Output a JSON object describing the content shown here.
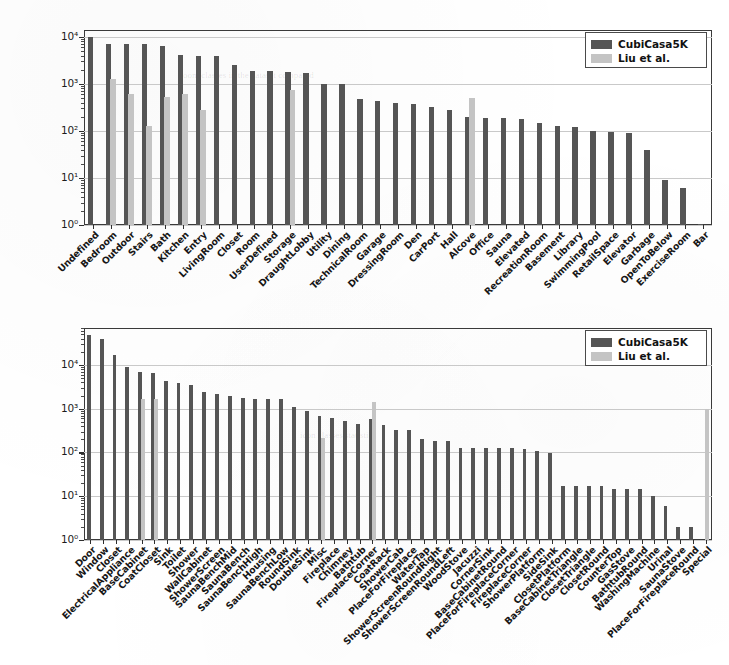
{
  "figure": {
    "background_color": "#ffffff",
    "series_colors": {
      "cubicasa": "#555555",
      "liu": "#c4c4c4"
    }
  },
  "legend": {
    "entries": [
      {
        "label": "CubiCasa5K",
        "color": "#555555"
      },
      {
        "label": "Liu et al.",
        "color": "#c4c4c4"
      }
    ]
  },
  "ghost": {
    "line1": "room classes in the dataset compared",
    "line2": "icon classes statistics"
  },
  "chart_data": [
    {
      "type": "bar",
      "title": "",
      "xlabel": "",
      "ylabel": "",
      "yscale": "log",
      "ylim": [
        1,
        14000
      ],
      "ytick_labels": [
        "10⁰",
        "10¹",
        "10²",
        "10³",
        "10⁴"
      ],
      "ytick_values": [
        1,
        10,
        100,
        1000,
        10000
      ],
      "grid": true,
      "legend_position": "upper right",
      "categories": [
        "Undefined",
        "Bedroom",
        "Outdoor",
        "Stairs",
        "Bath",
        "Kitchen",
        "Entry",
        "LivingRoom",
        "Closet",
        "Room",
        "UserDefined",
        "Storage",
        "DraughtLobby",
        "Utility",
        "Dining",
        "TechnicalRoom",
        "Garage",
        "DressingRoom",
        "Den",
        "CarPort",
        "Hall",
        "Alcove",
        "Office",
        "Sauna",
        "Elevated",
        "RecreationRoom",
        "Basement",
        "Library",
        "SwimmingPool",
        "RetailSpace",
        "Elevator",
        "Garbage",
        "OpenToBelow",
        "ExerciseRoom",
        "Bar"
      ],
      "series": [
        {
          "name": "CubiCasa5K",
          "color": "#555555",
          "values": [
            10000,
            7200,
            6900,
            6900,
            6400,
            4200,
            4000,
            3900,
            2500,
            1900,
            1900,
            1800,
            1700,
            1000,
            1000,
            470,
            430,
            400,
            380,
            330,
            280,
            200,
            190,
            190,
            180,
            150,
            130,
            120,
            100,
            95,
            90,
            40,
            9,
            6,
            1
          ]
        },
        {
          "name": "Liu et al.",
          "color": "#c4c4c4",
          "values": [
            null,
            1300,
            620,
            130,
            520,
            600,
            280,
            null,
            null,
            null,
            null,
            750,
            null,
            null,
            null,
            null,
            null,
            null,
            null,
            null,
            null,
            500,
            null,
            null,
            null,
            null,
            null,
            null,
            null,
            null,
            null,
            null,
            null,
            null,
            null
          ]
        }
      ]
    },
    {
      "type": "bar",
      "title": "",
      "xlabel": "",
      "ylabel": "",
      "yscale": "log",
      "ylim": [
        1,
        70000
      ],
      "ytick_labels": [
        "10⁰",
        "10¹",
        "10²",
        "10³",
        "10⁴"
      ],
      "ytick_values": [
        1,
        10,
        100,
        1000,
        10000
      ],
      "grid": true,
      "legend_position": "upper right",
      "categories": [
        "Door",
        "Window",
        "Closet",
        "ElectricalAppliance",
        "BaseCabinet",
        "CoatCloset",
        "Sink",
        "Toilet",
        "Shower",
        "WallCabinet",
        "ShowerScreen",
        "SaunaBenchMid",
        "SaunaBench",
        "SaunaBenchHigh",
        "Housing",
        "SaunaBenchLow",
        "RoundSink",
        "DoubleSink",
        "Misc",
        "Fireplace",
        "Chimney",
        "Bathtub",
        "FireplaceCorner",
        "CoatRack",
        "ShowerCab",
        "PlaceForFireplace",
        "WaterTap",
        "ShowerScreenRoundRight",
        "ShowerScreenRoundLeft",
        "WoodStove",
        "Jacuzzi",
        "CornerSink",
        "BaseCabinetRound",
        "PlaceForFireplaceCorner",
        "FireplaceCorner",
        "ShowerPlatform",
        "SideSink",
        "ClosetPlatform",
        "BaseCabinetTriangle",
        "ClosetTriangle",
        "ClosetRound",
        "CounterTop",
        "GasStove",
        "BathtubRound",
        "WashingMachine",
        "Urinal",
        "SaunaStove",
        "PlaceForFireplaceRound",
        "Special"
      ],
      "series": [
        {
          "name": "CubiCasa5K",
          "color": "#555555",
          "values": [
            48000,
            40000,
            17000,
            9000,
            7000,
            6400,
            4300,
            3900,
            3400,
            2400,
            2200,
            2000,
            1800,
            1700,
            1700,
            1700,
            1100,
            880,
            700,
            600,
            520,
            450,
            580,
            420,
            330,
            330,
            200,
            180,
            180,
            130,
            130,
            130,
            130,
            130,
            120,
            110,
            95,
            17,
            17,
            17,
            17,
            15,
            15,
            15,
            10,
            6,
            2,
            2,
            null
          ]
        },
        {
          "name": "Liu et al.",
          "color": "#c4c4c4",
          "values": [
            null,
            null,
            null,
            null,
            1700,
            1700,
            null,
            null,
            null,
            null,
            null,
            null,
            null,
            null,
            null,
            null,
            null,
            null,
            210,
            null,
            null,
            null,
            1400,
            null,
            null,
            null,
            null,
            null,
            null,
            null,
            null,
            null,
            null,
            null,
            null,
            null,
            null,
            null,
            null,
            null,
            null,
            null,
            null,
            null,
            null,
            null,
            null,
            null,
            1000
          ]
        }
      ]
    }
  ]
}
